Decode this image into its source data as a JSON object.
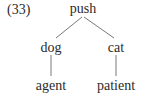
{
  "example_number": "(33)",
  "tree": {
    "root": {
      "label": "push"
    },
    "children": [
      {
        "label": "dog",
        "child": {
          "label": "agent"
        }
      },
      {
        "label": "cat",
        "child": {
          "label": "patient"
        }
      }
    ]
  },
  "colors": {
    "text": "#2a2a2a",
    "line": "#555555",
    "background": "#ffffff"
  }
}
